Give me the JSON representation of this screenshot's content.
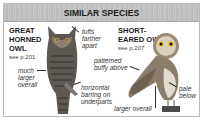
{
  "header": {
    "title": "SIMILAR SPECIES",
    "background_color": "#c2c2c2"
  },
  "species": [
    {
      "name_line1": "GREAT",
      "name_line2": "HORNED",
      "name_line3": "OWL",
      "see_ref": "see p.201",
      "image_icon": "great-horned-owl-illustration",
      "notes": [
        {
          "line1": "tufts",
          "line2": "farther",
          "line3": "apart"
        },
        {
          "line1": "much",
          "line2": "larger",
          "line3": "overall"
        },
        {
          "line1": "horizontal",
          "line2": "barring on",
          "line3": "underparts"
        }
      ]
    },
    {
      "name_line1": "SHORT-",
      "name_line2": "EARED OWL",
      "see_ref": "see p.207",
      "image_icon": "short-eared-owl-illustration",
      "notes": [
        {
          "line1": "patterned",
          "line2": "buffy above"
        },
        {
          "line1": "pale",
          "line2": "below"
        },
        {
          "line1": "larger overall"
        }
      ]
    }
  ]
}
